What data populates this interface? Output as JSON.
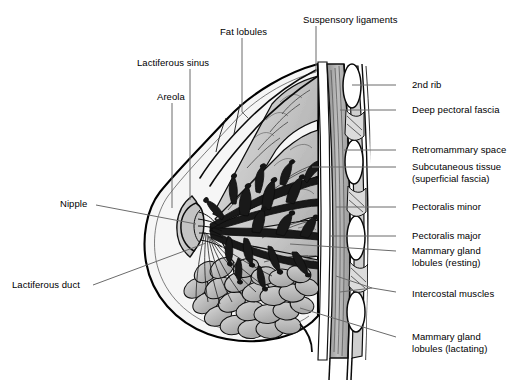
{
  "figure": {
    "type": "anatomical-diagram",
    "colors": {
      "background": "#ffffff",
      "ink": "#000000",
      "leader_line": "#6b6b6b",
      "fat_lobule_fill": "#c9c9c9",
      "fat_lobule_light": "#dedede",
      "gland_lobule_fill": "#b4b4b4",
      "duct_fill": "#1c1c1c",
      "muscle_fill": "#b9b9b9",
      "skin_fill": "#f2f2f2",
      "areola_fill": "#cccccc"
    }
  },
  "labels": [
    {
      "id": "suspensory-ligaments",
      "text": "Suspensory ligaments",
      "side": "top",
      "text_x": 303,
      "text_y": 14,
      "anchor": "left",
      "leader": "M 316 26 L 316 72"
    },
    {
      "id": "fat-lobules",
      "text": "Fat lobules",
      "side": "top",
      "text_x": 220,
      "text_y": 26,
      "anchor": "left",
      "leader": "M 242 38 L 242 112 L 248 118"
    },
    {
      "id": "lactiferous-sinus",
      "text": "Lactiferous sinus",
      "side": "top-left",
      "text_x": 137,
      "text_y": 57,
      "anchor": "left",
      "leader": "M 190 69 L 190 200"
    },
    {
      "id": "areola",
      "text": "Areola",
      "side": "left",
      "text_x": 157,
      "text_y": 91,
      "anchor": "left",
      "leader": "M 172 103 L 172 208"
    },
    {
      "id": "nipple",
      "text": "Nipple",
      "side": "left",
      "text_x": 60,
      "text_y": 198,
      "anchor": "left",
      "leader": "M 96 205 L 196 224"
    },
    {
      "id": "lactiferous-duct",
      "text": "Lactiferous duct",
      "side": "left",
      "text_x": 12,
      "text_y": 279,
      "anchor": "left",
      "leader": "M 93 285 L 206 243"
    },
    {
      "id": "second-rib",
      "text": "2nd rib",
      "side": "right",
      "text_x": 412,
      "text_y": 79,
      "anchor": "left",
      "leader": "M 396 85 L 352 85"
    },
    {
      "id": "deep-pectoral-fascia",
      "text": "Deep pectoral fascia",
      "side": "right",
      "text_x": 412,
      "text_y": 104,
      "anchor": "left",
      "leader": "M 396 110 L 340 110"
    },
    {
      "id": "retromammary-space",
      "text": "Retromammary space",
      "side": "right",
      "text_x": 412,
      "text_y": 144,
      "anchor": "left",
      "leader": "M 396 150 L 344 150"
    },
    {
      "id": "subcutaneous-tissue",
      "text": "Subcutaneous tissue\n(superficial fascia)",
      "side": "right",
      "text_x": 412,
      "text_y": 161,
      "anchor": "left",
      "leader": "M 396 167 L 312 167"
    },
    {
      "id": "pectoralis-minor",
      "text": "Pectoralis minor",
      "side": "right",
      "text_x": 412,
      "text_y": 201,
      "anchor": "left",
      "leader": "M 396 207 L 336 207"
    },
    {
      "id": "pectoralis-major",
      "text": "Pectoralis major",
      "side": "right",
      "text_x": 412,
      "text_y": 230,
      "anchor": "left",
      "leader": "M 396 236 L 330 236"
    },
    {
      "id": "mammary-gland-lobules-resting",
      "text": "Mammary gland\nlobules (resting)",
      "side": "right",
      "text_x": 412,
      "text_y": 245,
      "anchor": "left",
      "leader": "M 396 251 L 290 244"
    },
    {
      "id": "intercostal-muscles",
      "text": "Intercostal muscles",
      "side": "right",
      "text_x": 412,
      "text_y": 288,
      "anchor": "left",
      "leader": "M 396 292 L 372 288 L 336 276 M 372 288 L 340 292"
    },
    {
      "id": "mammary-gland-lobules-lactating",
      "text": "Mammary gland\nlobules (lactating)",
      "side": "right",
      "text_x": 412,
      "text_y": 331,
      "anchor": "left",
      "leader": "M 396 337 L 300 308"
    }
  ],
  "anatomy_parts": [
    {
      "id": "skin-outline",
      "name": "breast skin contour"
    },
    {
      "id": "nipple-body",
      "name": "nipple"
    },
    {
      "id": "areola-body",
      "name": "areola"
    },
    {
      "id": "fat-lobule-group",
      "name": "fat lobules (upper wedges)",
      "count": 5
    },
    {
      "id": "duct-tree",
      "name": "lactiferous duct tree"
    },
    {
      "id": "lactating-lobule-group",
      "name": "mammary gland lobules (lactating)"
    },
    {
      "id": "chest-wall",
      "name": "anterior chest wall layers"
    },
    {
      "id": "rib-group",
      "name": "ribs",
      "count": 3
    },
    {
      "id": "pectoralis-major-muscle",
      "name": "pectoralis major"
    },
    {
      "id": "pectoralis-minor-muscle",
      "name": "pectoralis minor"
    },
    {
      "id": "intercostal-muscle-group",
      "name": "intercostal muscles"
    }
  ]
}
